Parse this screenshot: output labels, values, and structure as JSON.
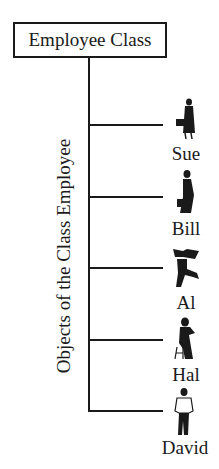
{
  "diagram": {
    "class_box": {
      "label": "Employee Class"
    },
    "axis_label": "Objects of the Class Employee",
    "objects": [
      {
        "name": "Sue",
        "pose": "woman-with-briefcase-walking"
      },
      {
        "name": "Bill",
        "pose": "man-with-briefcase-walking"
      },
      {
        "name": "Al",
        "pose": "man-carrying-box-running"
      },
      {
        "name": "Hal",
        "pose": "man-sitting-on-stool"
      },
      {
        "name": "David",
        "pose": "man-standing"
      }
    ],
    "colors": {
      "line": "#1a1a1a",
      "background": "#ffffff"
    }
  }
}
